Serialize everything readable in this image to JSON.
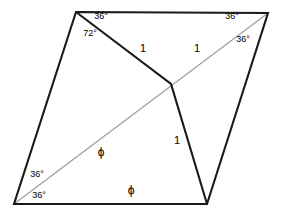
{
  "figure": {
    "background_color": "#ffffff",
    "stroke_color": "#1a1a1a",
    "diagonal_color": "#9a9a9a",
    "width": 281,
    "height": 216
  },
  "chart_data": {
    "type": "diagram",
    "shape": "rhombus",
    "vertices": [
      {
        "name": "top-left",
        "x": 76,
        "y": 12
      },
      {
        "name": "top-right",
        "x": 268,
        "y": 13
      },
      {
        "name": "bottom-right",
        "x": 207,
        "y": 204
      },
      {
        "name": "bottom-left",
        "x": 14,
        "y": 204
      }
    ],
    "interior_points": [
      {
        "name": "junction",
        "x": 171,
        "y": 84
      }
    ],
    "edges": [
      {
        "from": "top-left",
        "to": "top-right",
        "style": "solid-dark"
      },
      {
        "from": "top-right",
        "to": "bottom-right",
        "style": "solid-dark"
      },
      {
        "from": "bottom-right",
        "to": "bottom-left",
        "style": "solid-dark"
      },
      {
        "from": "bottom-left",
        "to": "top-left",
        "style": "solid-dark"
      },
      {
        "from": "top-left",
        "to": "junction",
        "style": "solid-dark",
        "length_label": "1"
      },
      {
        "from": "junction",
        "to": "bottom-right",
        "style": "solid-dark",
        "length_label": "1"
      },
      {
        "from": "bottom-left",
        "to": "top-right",
        "style": "diagonal-gray",
        "length_label": "ϕ"
      }
    ]
  },
  "labels": {
    "angle_top_left_inner": {
      "text": "36°",
      "x": 101,
      "y": 16
    },
    "angle_top_left_vertex": {
      "text": "72°",
      "x": 90,
      "y": 33
    },
    "angle_top_right_upper": {
      "text": "36°",
      "x": 232,
      "y": 16
    },
    "angle_top_right_lower": {
      "text": "36°",
      "x": 243,
      "y": 39
    },
    "angle_bottom_left_upper": {
      "text": "36°",
      "x": 37,
      "y": 174
    },
    "angle_bottom_left_lower": {
      "text": "36°",
      "x": 39,
      "y": 195
    },
    "length_upper_left": {
      "text": "1",
      "x": 143,
      "y": 48
    },
    "length_upper_right": {
      "text": "1",
      "x": 197,
      "y": 48
    },
    "length_lower": {
      "text": "1",
      "x": 177,
      "y": 140
    },
    "phi_diagonal": {
      "text": "ϕ",
      "x": 101,
      "y": 152
    },
    "phi_bottom": {
      "text": "ϕ",
      "x": 131,
      "y": 190
    }
  }
}
